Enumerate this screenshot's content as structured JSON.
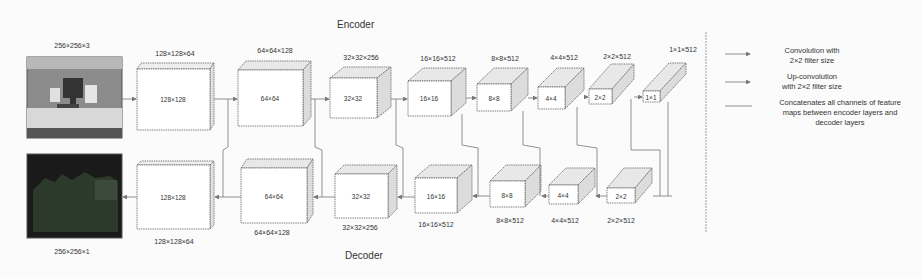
{
  "figure": {
    "encoder_title": "Encoder",
    "decoder_title": "Decoder",
    "input_image": {
      "label": "256×256×3",
      "description": "RGB photo of a desk with computer monitor"
    },
    "output_image": {
      "label": "256×256×1",
      "description": "dark single-channel depth/segmentation map"
    },
    "encoder_blocks": [
      {
        "size_label": "128×128×64",
        "face_label": "128×128"
      },
      {
        "size_label": "64×64×128",
        "face_label": "64×64"
      },
      {
        "size_label": "32×32×256",
        "face_label": "32×32"
      },
      {
        "size_label": "16×16×512",
        "face_label": "16×16"
      },
      {
        "size_label": "8×8×512",
        "face_label": "8×8"
      },
      {
        "size_label": "4×4×512",
        "face_label": "4×4"
      },
      {
        "size_label": "2×2×512",
        "face_label": "2×2"
      },
      {
        "size_label": "1×1×512",
        "face_label": "1×1"
      }
    ],
    "decoder_blocks": [
      {
        "size_label": "128×128×64",
        "face_label": "128×128"
      },
      {
        "size_label": "64×64×128",
        "face_label": "64×64"
      },
      {
        "size_label": "32×32×256",
        "face_label": "32×32"
      },
      {
        "size_label": "16×16×512",
        "face_label": "16×16"
      },
      {
        "size_label": "8×8×512",
        "face_label": "8×8"
      },
      {
        "size_label": "4×4×512",
        "face_label": "4×4"
      },
      {
        "size_label": "2×2×512",
        "face_label": "2×2"
      }
    ],
    "legend": [
      {
        "icon": "arrow-right-icon",
        "text_line1": "Convolution with",
        "text_line2": "2×2 filter size"
      },
      {
        "icon": "arrow-right-icon",
        "text_line1": "Up-convolution",
        "text_line2": "with 2×2 filter size"
      },
      {
        "icon": "line-icon",
        "text_line1": "Concatenates all channels of feature",
        "text_line2": "maps between encoder  layers and",
        "text_line3": "decoder layers"
      }
    ]
  }
}
